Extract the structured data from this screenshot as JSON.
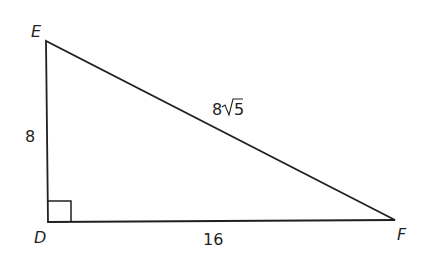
{
  "diagram": {
    "type": "right-triangle",
    "vertices": {
      "E": {
        "label": "E",
        "x": 46,
        "y": 41
      },
      "D": {
        "label": "D",
        "x": 48,
        "y": 222
      },
      "F": {
        "label": "F",
        "x": 395,
        "y": 220
      }
    },
    "right_angle_at": "D",
    "sides": {
      "ED": {
        "label": "8"
      },
      "DF": {
        "label": "16"
      },
      "EF": {
        "label_coef": "8",
        "label_radical": "5",
        "label": "8√5"
      }
    },
    "stroke_color": "#231f20"
  }
}
